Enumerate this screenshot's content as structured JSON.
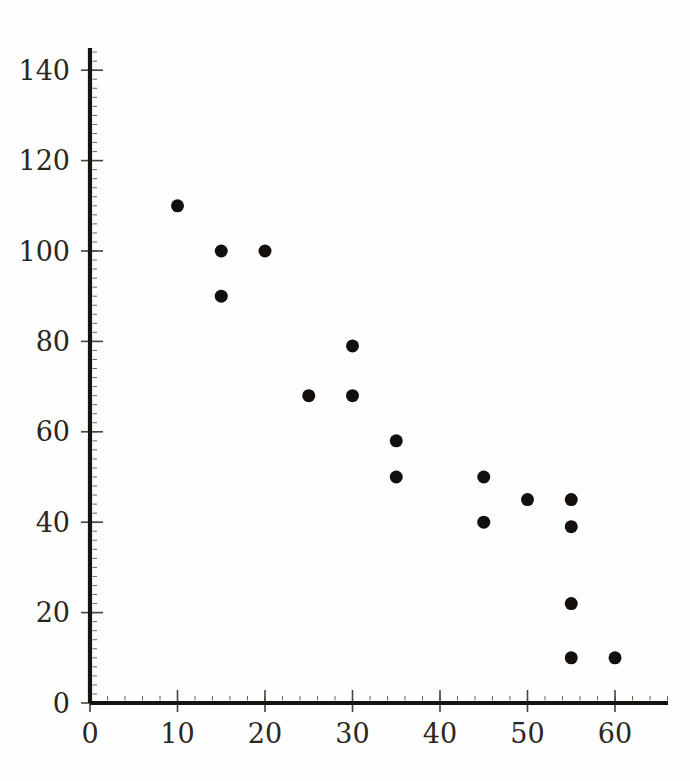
{
  "chart_data": {
    "type": "scatter",
    "title": "",
    "subtitle": "",
    "xlabel": "",
    "ylabel": "",
    "xlim": [
      0,
      66
    ],
    "ylim": [
      0,
      147
    ],
    "xticks": [
      0,
      10,
      20,
      30,
      40,
      50,
      60
    ],
    "yticks": [
      0,
      20,
      40,
      60,
      80,
      100,
      120,
      140
    ],
    "xtick_labels": [
      "0",
      "10",
      "20",
      "30",
      "40",
      "50",
      "60"
    ],
    "ytick_labels": [
      "0",
      "20",
      "40",
      "60",
      "80",
      "100",
      "120",
      "140"
    ],
    "grid": false,
    "legend": null,
    "legend_position": "none",
    "marker": "filled-circle",
    "marker_color": "#130f0c",
    "marker_size_px": 13,
    "background_color": "#fefefe",
    "axis_color": "#171310",
    "series": [
      {
        "name": "observations",
        "points": [
          [
            10,
            110
          ],
          [
            15,
            100
          ],
          [
            20,
            100
          ],
          [
            15,
            90
          ],
          [
            30,
            79
          ],
          [
            25,
            68
          ],
          [
            30,
            68
          ],
          [
            35,
            58
          ],
          [
            35,
            50
          ],
          [
            45,
            50
          ],
          [
            50,
            45
          ],
          [
            55,
            45
          ],
          [
            45,
            40
          ],
          [
            55,
            39
          ],
          [
            55,
            22
          ],
          [
            55,
            10
          ],
          [
            60,
            10
          ]
        ],
        "x": [
          10,
          15,
          20,
          15,
          30,
          25,
          30,
          35,
          35,
          45,
          50,
          55,
          45,
          55,
          55,
          55,
          60
        ],
        "y": [
          110,
          100,
          100,
          90,
          79,
          68,
          68,
          58,
          50,
          50,
          45,
          45,
          40,
          39,
          22,
          10,
          10
        ]
      }
    ],
    "n_points": 17,
    "annotations": []
  },
  "axes_geometry": {
    "origin_x_px": 90,
    "origin_y_px": 703,
    "x_px_per_unit": 8.75,
    "y_px_per_unit": 4.52,
    "x_axis_end_px": 668,
    "y_axis_top_px": 48
  }
}
